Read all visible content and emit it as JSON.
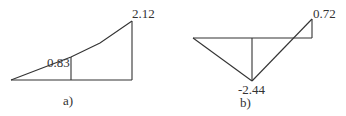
{
  "diagrams": [
    {
      "id": "a",
      "caption": "a)",
      "labels": {
        "mid_value": "0.83",
        "end_value": "2.12"
      },
      "values": [
        0,
        0.83,
        2.12
      ]
    },
    {
      "id": "b",
      "caption": "b)",
      "labels": {
        "min_value": "-2.44",
        "end_value": "0.72"
      },
      "values": [
        0,
        -2.44,
        0.72
      ]
    }
  ],
  "colors": {
    "line": "#333333",
    "text": "#333333"
  }
}
